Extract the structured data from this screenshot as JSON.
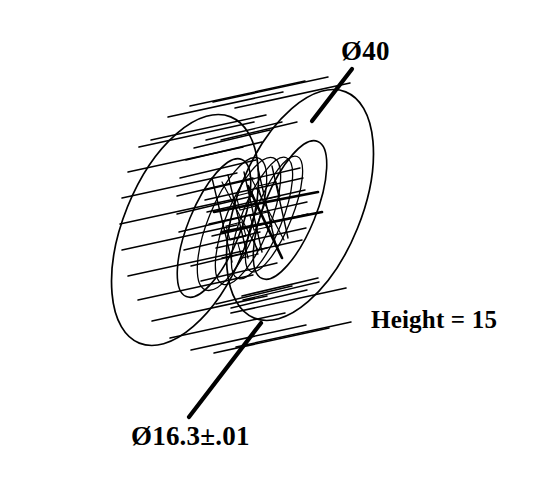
{
  "drawing": {
    "title": "Wireframe cylindrical bushing",
    "projection": "isometric wireframe",
    "background_color": "#ffffff",
    "line_color": "#000000",
    "annotations": [
      {
        "id": "outer-diameter",
        "text": "Ø40",
        "meaning": "outer diameter 40",
        "symbol": "Ø",
        "value": "40",
        "has_leader": true
      },
      {
        "id": "bore-diameter",
        "text": "Ø16.3±.01",
        "meaning": "bore diameter 16.3 plus or minus .01",
        "symbol": "Ø",
        "value": "16.3",
        "tolerance": "±.01",
        "has_leader": true
      },
      {
        "id": "height",
        "text": "Height = 15",
        "meaning": "cylinder height 15",
        "value": "15",
        "has_leader": false
      }
    ],
    "geometry": {
      "outer_cylinder": {
        "near_face_center_x": 185,
        "near_face_center_y": 230,
        "far_face_center_x": 300,
        "far_face_center_y": 205,
        "rim_radius_x": 62,
        "rim_radius_y": 122,
        "rim_rotation_deg": 22,
        "meridian_count": 18,
        "profile_line_count": 13
      },
      "inner_bore": {
        "near_face_center_x": 214,
        "near_face_center_y": 228,
        "far_face_center_x": 290,
        "far_face_center_y": 210,
        "rim_radius_x": 26,
        "rim_radius_y": 74,
        "rim_rotation_deg": 22,
        "meridian_count": 16,
        "profile_line_count": 11
      }
    }
  }
}
